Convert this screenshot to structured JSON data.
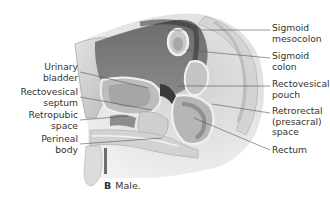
{
  "figure": {
    "caption_letter": "B",
    "caption_text": "Male.",
    "labels_left": [
      {
        "id": "urinary-bladder",
        "lines": [
          "Urinary",
          "bladder"
        ]
      },
      {
        "id": "rectovesical-septum",
        "lines": [
          "Rectovesical",
          "septum"
        ]
      },
      {
        "id": "retropubic-space",
        "lines": [
          "Retropubic",
          "space"
        ]
      },
      {
        "id": "perineal-body",
        "lines": [
          "Perineal",
          "body"
        ]
      }
    ],
    "labels_right": [
      {
        "id": "sigmoid-mesocolon",
        "lines": [
          "Sigmoid",
          "mesocolon"
        ]
      },
      {
        "id": "sigmoid-colon",
        "lines": [
          "Sigmoid",
          "colon"
        ]
      },
      {
        "id": "rectovesical-pouch",
        "lines": [
          "Rectovesical",
          "pouch"
        ]
      },
      {
        "id": "retrorectal-space",
        "lines": [
          "Retrorectal",
          "(presacral)",
          "space"
        ]
      },
      {
        "id": "rectum",
        "lines": [
          "Rectum"
        ]
      }
    ]
  }
}
